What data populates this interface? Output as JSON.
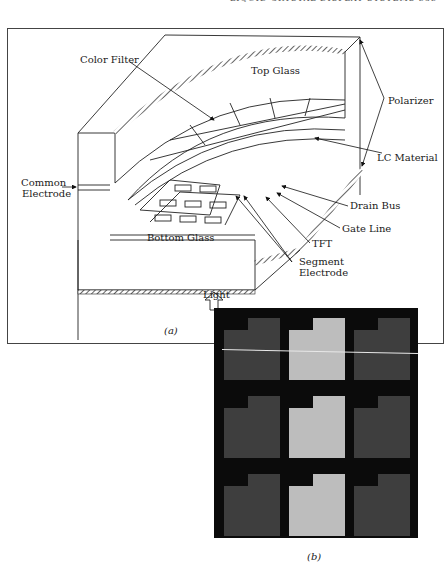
{
  "page": {
    "running_header": "LIQUID CRYSTAL DISPLAY SYSTEMS   383"
  },
  "figure_a": {
    "caption": "(a)",
    "labels": {
      "color_filter": "Color Filter",
      "top_glass": "Top Glass",
      "polarizer": "Polarizer",
      "lc_material": "LC Material",
      "common_electrode_line1": "Common",
      "common_electrode_line2": "Electrode",
      "drain_bus": "Drain Bus",
      "gate_line": "Gate Line",
      "tft": "TFT",
      "segment_electrode_line1": "Segment",
      "segment_electrode_line2": "Electrode",
      "bottom_glass": "Bottom Glass",
      "light": "Light"
    }
  },
  "figure_b": {
    "caption": "(b)",
    "grid": {
      "rows": 3,
      "cols": 3
    },
    "cells": [
      [
        "dark",
        "bright",
        "dark"
      ],
      [
        "dark",
        "bright",
        "dark"
      ],
      [
        "dark",
        "bright",
        "dark"
      ]
    ],
    "colors": {
      "background": "#0b0b0b",
      "dark_cell": "#3e3e3e",
      "bright_cell": "#bdbdbd"
    }
  }
}
